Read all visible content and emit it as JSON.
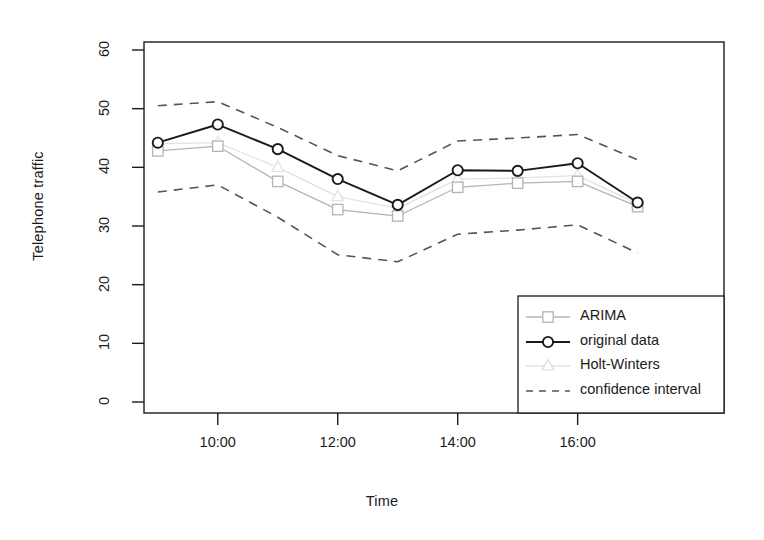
{
  "chart_data": {
    "type": "line",
    "title": "",
    "xlabel": "Time",
    "ylabel": "Telephone traffic",
    "x": [
      "9:00",
      "10:00",
      "11:00",
      "12:00",
      "13:00",
      "14:00",
      "15:00",
      "16:00",
      "17:00"
    ],
    "xtick_labels": [
      "10:00",
      "12:00",
      "14:00",
      "16:00"
    ],
    "xtick_values": [
      10,
      12,
      14,
      16
    ],
    "ytick_labels": [
      "0",
      "10",
      "20",
      "30",
      "40",
      "50",
      "60"
    ],
    "ytick_values": [
      0,
      10,
      20,
      30,
      40,
      50,
      60
    ],
    "xlim": [
      8.77,
      18.44
    ],
    "ylim": [
      0,
      63
    ],
    "grid": false,
    "legend_position": "bottom-right",
    "series": [
      {
        "name": "ARIMA",
        "marker": "square",
        "linestyle": "solid",
        "color": "#b4b4b4",
        "values": [
          42.8,
          43.6,
          37.6,
          32.8,
          31.7,
          36.6,
          37.3,
          37.6,
          33.3
        ]
      },
      {
        "name": "original data",
        "marker": "circle",
        "linestyle": "solid",
        "color": "#1a1a1a",
        "values": [
          44.2,
          47.3,
          43.1,
          38.0,
          33.6,
          39.5,
          39.4,
          40.7,
          34.0
        ]
      },
      {
        "name": "Holt-Winters",
        "marker": "triangle",
        "linestyle": "solid",
        "color": "#e2e2e2",
        "values": [
          44.0,
          44.2,
          40.0,
          35.0,
          33.0,
          38.0,
          38.2,
          38.6,
          33.8
        ]
      },
      {
        "name": "confidence interval",
        "marker": "none",
        "linestyle": "dashed",
        "color": "#555555",
        "upper": [
          50.5,
          51.2,
          46.8,
          42.0,
          39.4,
          44.5,
          45.0,
          45.6,
          41.3
        ],
        "lower": [
          35.8,
          37.0,
          31.5,
          25.1,
          23.9,
          28.6,
          29.3,
          30.2,
          25.4
        ]
      }
    ]
  },
  "legend": {
    "entries": [
      {
        "label": "ARIMA",
        "icon": "square-marker-line-icon"
      },
      {
        "label": "original data",
        "icon": "circle-marker-line-icon"
      },
      {
        "label": "Holt-Winters",
        "icon": "triangle-marker-line-icon"
      },
      {
        "label": "confidence interval",
        "icon": "dashed-line-icon"
      }
    ]
  },
  "colors": {
    "axis": "#1a1a1a",
    "original": "#1a1a1a",
    "arima": "#b4b4b4",
    "holtwinters": "#e2e2e2",
    "ci": "#555555",
    "background": "#ffffff"
  }
}
